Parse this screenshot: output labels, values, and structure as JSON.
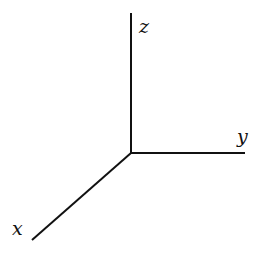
{
  "diagram": {
    "title": "",
    "origin": [
      131,
      153
    ],
    "stroke_color": "#111111",
    "background": "#ffffff",
    "axes": [
      {
        "name": "z",
        "label": "z",
        "end": [
          131,
          13
        ],
        "label_pos": [
          144,
          33
        ]
      },
      {
        "name": "y",
        "label": "y",
        "end": [
          245,
          153
        ],
        "label_pos": [
          238,
          142
        ]
      },
      {
        "name": "x",
        "label": "x",
        "end": [
          32,
          240
        ],
        "label_pos": [
          12,
          234
        ]
      }
    ]
  }
}
